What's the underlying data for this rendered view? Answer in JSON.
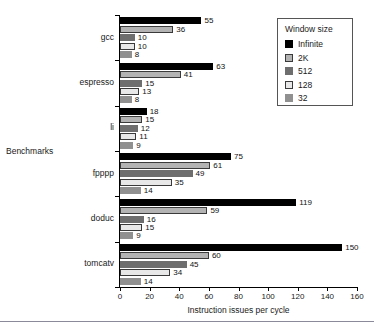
{
  "chart_data": {
    "type": "bar",
    "orientation": "horizontal",
    "title": "",
    "xlabel": "Instruction issues per cycle",
    "ylabel": "Benchmarks",
    "xlim": [
      0,
      160
    ],
    "xticks": [
      0,
      20,
      40,
      60,
      80,
      100,
      120,
      140,
      160
    ],
    "grid": false,
    "legend_position": "top-right",
    "legend_title": "Window size",
    "categories": [
      "gcc",
      "espresso",
      "li",
      "fpppp",
      "doduc",
      "tomcatv"
    ],
    "series": [
      {
        "name": "Infinite",
        "color": "#000000",
        "values": [
          55,
          63,
          18,
          75,
          119,
          150
        ]
      },
      {
        "name": "2K",
        "color": "#b3b3b3",
        "values": [
          36,
          41,
          15,
          61,
          59,
          60
        ]
      },
      {
        "name": "512",
        "color": "#6e6e6e",
        "values": [
          10,
          15,
          12,
          49,
          16,
          45
        ]
      },
      {
        "name": "128",
        "color": "#e8e8e8",
        "values": [
          10,
          13,
          11,
          35,
          15,
          34
        ]
      },
      {
        "name": "32",
        "color": "#909090",
        "values": [
          8,
          8,
          9,
          14,
          9,
          14
        ]
      }
    ]
  },
  "legend": {
    "title": "Window size",
    "items": [
      {
        "label": "Infinite",
        "color": "#000000",
        "outline": false
      },
      {
        "label": "2K",
        "color": "#b3b3b3",
        "outline": true
      },
      {
        "label": "512",
        "color": "#6e6e6e",
        "outline": false
      },
      {
        "label": "128",
        "color": "#e8e8e8",
        "outline": true
      },
      {
        "label": "32",
        "color": "#909090",
        "outline": false
      }
    ]
  },
  "axes": {
    "x_label": "Instruction issues per cycle",
    "y_label": "Benchmarks",
    "x_tick_labels": [
      "0",
      "20",
      "40",
      "60",
      "80",
      "100",
      "120",
      "140",
      "160"
    ]
  }
}
